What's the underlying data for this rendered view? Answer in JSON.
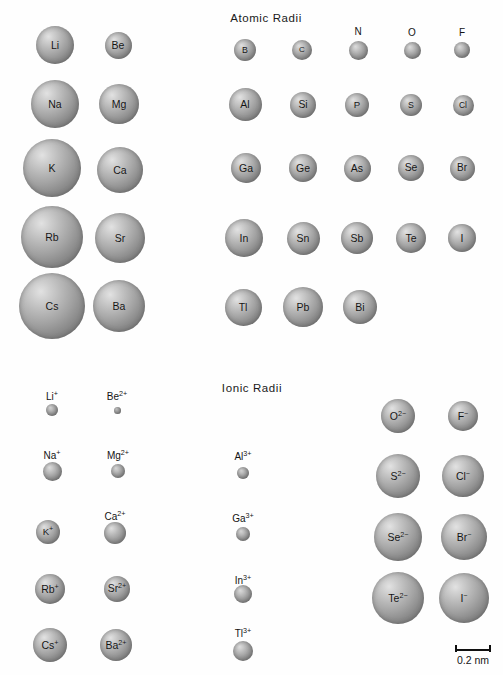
{
  "figure": {
    "width": 503,
    "height": 675,
    "background_color": "#fefefe",
    "sphere_fill": "#a2a2a2",
    "label_color": "#141414"
  },
  "sections": {
    "atomic": {
      "title": "Atomic Radii",
      "x": 266,
      "y": 12
    },
    "ionic": {
      "title": "Ionic Radii",
      "x": 252,
      "y": 382
    }
  },
  "scale": {
    "label": "0.2 nm",
    "x": 455,
    "y": 643,
    "length": 36,
    "value_nm": 0.2,
    "px_per_nm": 180
  },
  "chart_data": {
    "type": "scatter",
    "xlabel": "",
    "ylabel": "",
    "legend": [],
    "grid": false,
    "scale_bar_nm": 0.2,
    "scale_bar_px": 36,
    "note": "Sphere diameters are drawn to a common scale; radius in nm = px_radius / 180.",
    "series": [
      {
        "name": "Atomic Radii",
        "points": [
          {
            "label": "Li",
            "x": 55,
            "y": 45,
            "r": 19.0
          },
          {
            "label": "Be",
            "x": 118,
            "y": 45,
            "r": 13.5
          },
          {
            "label": "B",
            "x": 245,
            "y": 50,
            "r": 11.0
          },
          {
            "label": "C",
            "x": 302,
            "y": 50,
            "r": 10.0
          },
          {
            "label": "N",
            "x": 358,
            "y": 50,
            "r": 9.5
          },
          {
            "label": "O",
            "x": 412,
            "y": 50,
            "r": 8.5
          },
          {
            "label": "F",
            "x": 462,
            "y": 50,
            "r": 8.0
          },
          {
            "label": "Na",
            "x": 55,
            "y": 104,
            "r": 24.0
          },
          {
            "label": "Mg",
            "x": 119,
            "y": 104,
            "r": 20.0
          },
          {
            "label": "Al",
            "x": 245,
            "y": 104,
            "r": 16.5
          },
          {
            "label": "Si",
            "x": 303,
            "y": 105,
            "r": 13.0
          },
          {
            "label": "P",
            "x": 357,
            "y": 105,
            "r": 12.0
          },
          {
            "label": "S",
            "x": 411,
            "y": 105,
            "r": 11.0
          },
          {
            "label": "Cl",
            "x": 463,
            "y": 105,
            "r": 10.5
          },
          {
            "label": "K",
            "x": 52,
            "y": 168,
            "r": 29.0
          },
          {
            "label": "Ca",
            "x": 120,
            "y": 170,
            "r": 23.0
          },
          {
            "label": "Ga",
            "x": 246,
            "y": 168,
            "r": 15.0
          },
          {
            "label": "Ge",
            "x": 303,
            "y": 168,
            "r": 14.0
          },
          {
            "label": "As",
            "x": 357,
            "y": 168,
            "r": 13.5
          },
          {
            "label": "Se",
            "x": 411,
            "y": 168,
            "r": 13.0
          },
          {
            "label": "Br",
            "x": 462,
            "y": 168,
            "r": 12.5
          },
          {
            "label": "Rb",
            "x": 52,
            "y": 237,
            "r": 31.0
          },
          {
            "label": "Sr",
            "x": 120,
            "y": 238,
            "r": 25.0
          },
          {
            "label": "In",
            "x": 244,
            "y": 238,
            "r": 19.0
          },
          {
            "label": "Sn",
            "x": 303,
            "y": 238,
            "r": 16.5
          },
          {
            "label": "Sb",
            "x": 357,
            "y": 238,
            "r": 16.0
          },
          {
            "label": "Te",
            "x": 411,
            "y": 238,
            "r": 15.0
          },
          {
            "label": "I",
            "x": 462,
            "y": 238,
            "r": 14.0
          },
          {
            "label": "Cs",
            "x": 52,
            "y": 306,
            "r": 33.0
          },
          {
            "label": "Ba",
            "x": 119,
            "y": 306,
            "r": 26.0
          },
          {
            "label": "Tl",
            "x": 243,
            "y": 307,
            "r": 18.5
          },
          {
            "label": "Pb",
            "x": 303,
            "y": 307,
            "r": 20.0
          },
          {
            "label": "Bi",
            "x": 360,
            "y": 307,
            "r": 17.0
          }
        ]
      },
      {
        "name": "Ionic Radii",
        "points": [
          {
            "label": "Li",
            "charge": "+",
            "x": 52,
            "y": 410,
            "r": 6.0,
            "label_outside": true,
            "label_y": 392
          },
          {
            "label": "Be",
            "charge": "2+",
            "x": 117,
            "y": 410,
            "r": 3.5,
            "label_outside": true,
            "label_y": 392
          },
          {
            "label": "Na",
            "charge": "+",
            "x": 52,
            "y": 471,
            "r": 9.5,
            "label_outside": true,
            "label_y": 451
          },
          {
            "label": "Mg",
            "charge": "2+",
            "x": 118,
            "y": 471,
            "r": 7.0,
            "label_outside": true,
            "label_y": 451
          },
          {
            "label": "Al",
            "charge": "3+",
            "x": 243,
            "y": 473,
            "r": 6.0,
            "label_outside": true,
            "label_y": 452
          },
          {
            "label": "O",
            "charge": "2-",
            "x": 398,
            "y": 416,
            "r": 17.0,
            "label_outside": false
          },
          {
            "label": "F",
            "charge": "-",
            "x": 463,
            "y": 416,
            "r": 15.0,
            "label_outside": false
          },
          {
            "label": "K",
            "charge": "+",
            "x": 48,
            "y": 532,
            "r": 12.0,
            "label_outside": false
          },
          {
            "label": "Ca",
            "charge": "2+",
            "x": 115,
            "y": 533,
            "r": 11.0,
            "label_outside": true,
            "label_y": 512
          },
          {
            "label": "Ga",
            "charge": "3+",
            "x": 243,
            "y": 534,
            "r": 7.0,
            "label_outside": true,
            "label_y": 514
          },
          {
            "label": "S",
            "charge": "2-",
            "x": 398,
            "y": 476,
            "r": 22.0,
            "label_outside": false
          },
          {
            "label": "Cl",
            "charge": "-",
            "x": 463,
            "y": 476,
            "r": 21.0,
            "label_outside": false
          },
          {
            "label": "Rb",
            "charge": "+",
            "x": 50,
            "y": 589,
            "r": 15.0,
            "label_outside": false
          },
          {
            "label": "Sr",
            "charge": "2+",
            "x": 117,
            "y": 589,
            "r": 13.0,
            "label_outside": false
          },
          {
            "label": "In",
            "charge": "3+",
            "x": 243,
            "y": 594,
            "r": 9.0,
            "label_outside": true,
            "label_y": 576
          },
          {
            "label": "Se",
            "charge": "2-",
            "x": 398,
            "y": 537,
            "r": 24.0,
            "label_outside": false
          },
          {
            "label": "Br",
            "charge": "-",
            "x": 464,
            "y": 537,
            "r": 23.0,
            "label_outside": false
          },
          {
            "label": "Cs",
            "charge": "+",
            "x": 50,
            "y": 645,
            "r": 17.0,
            "label_outside": false
          },
          {
            "label": "Ba",
            "charge": "2+",
            "x": 116,
            "y": 645,
            "r": 16.0,
            "label_outside": false
          },
          {
            "label": "Tl",
            "charge": "3+",
            "x": 243,
            "y": 651,
            "r": 10.0,
            "label_outside": true,
            "label_y": 629
          },
          {
            "label": "Te",
            "charge": "2-",
            "x": 398,
            "y": 598,
            "r": 26.0,
            "label_outside": false
          },
          {
            "label": "I",
            "charge": "-",
            "x": 464,
            "y": 598,
            "r": 25.0,
            "label_outside": false
          }
        ]
      }
    ]
  }
}
